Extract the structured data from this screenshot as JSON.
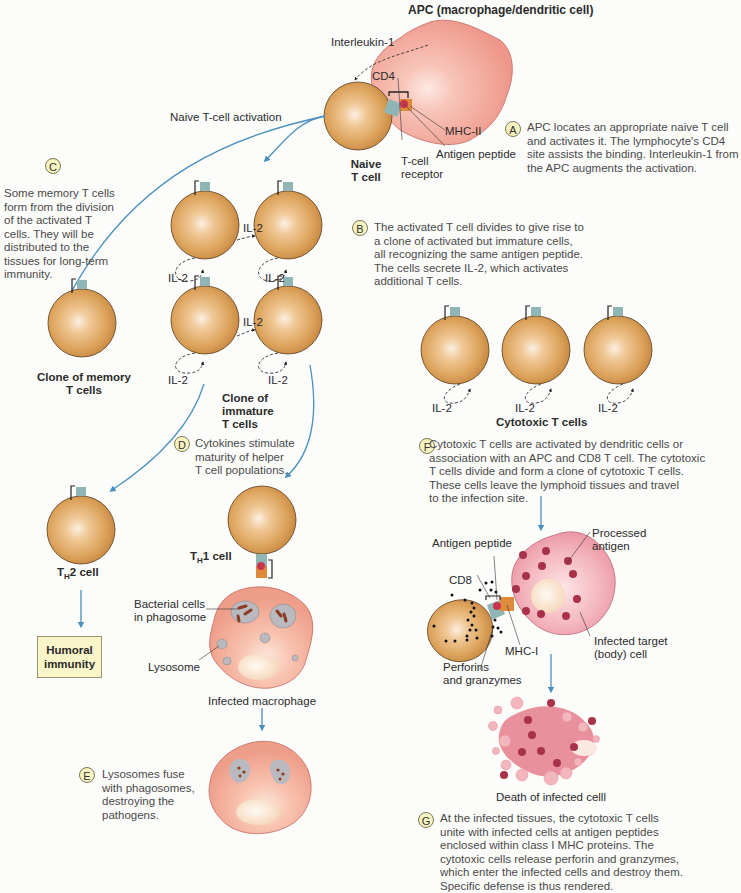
{
  "title": "APC (macrophage/dendritic cell)",
  "labels": {
    "interleukin1": "Interleukin-1",
    "cd4": "CD4",
    "mhc2": "MHC-II",
    "antigen_peptide_top": "Antigen peptide",
    "tcell_receptor_1": "T-cell",
    "tcell_receptor_2": "receptor",
    "naive_1": "Naive",
    "naive_2": "T cell",
    "naive_activation": "Naive T-cell activation",
    "il2": "IL-2",
    "clone_memory_1": "Clone of memory",
    "clone_memory_2": "T cells",
    "clone_immature_1": "Clone of",
    "clone_immature_2": "immature",
    "clone_immature_3": "T cells",
    "cytotoxic": "Cytotoxic T cells",
    "th2_prefix": "T",
    "th2_sub": "H",
    "th2_suffix": "2 cell",
    "th1_prefix": "T",
    "th1_sub": "H",
    "th1_suffix": "1 cell",
    "humoral_1": "Humoral",
    "humoral_2": "immunity",
    "bacterial_1": "Bacterial cells",
    "bacterial_2": "in phagosome",
    "lysosome": "Lysosome",
    "infected_macrophage": "Infected macrophage",
    "antigen_peptide_f": "Antigen peptide",
    "processed_1": "Processed",
    "processed_2": "antigen",
    "cd8": "CD8",
    "mhc1": "MHC-I",
    "perforins_1": "Perforins",
    "perforins_2": "and granzymes",
    "infected_target_1": "Infected target",
    "infected_target_2": "(body) cell",
    "death": "Death of infected celll"
  },
  "notes": {
    "A": {
      "badge": "A",
      "lines": [
        "APC locates an appropriate naive T cell",
        "and activates it. The lymphocyte's CD4",
        "site assists the binding. Interleukin-1 from",
        "the APC augments the activation."
      ]
    },
    "B": {
      "badge": "B",
      "lines": [
        "The activated T cell divides to give rise to",
        "a clone of activated but immature cells,",
        "all recognizing the same antigen peptide.",
        "The cells secrete IL-2, which activates",
        "additional T cells."
      ]
    },
    "C": {
      "badge": "C",
      "lines": [
        "Some memory T cells",
        "form from the division",
        "of the activated T",
        "cells. They will be",
        "distributed to the",
        "tissues for long-term",
        "immunity."
      ]
    },
    "D": {
      "badge": "D",
      "lines": [
        "Cytokines stimulate",
        "maturity of helper",
        "T cell populations."
      ]
    },
    "E": {
      "badge": "E",
      "lines": [
        "Lysosomes fuse",
        "with phagosomes,",
        "destroying the",
        "pathogens."
      ]
    },
    "F": {
      "badge": "F",
      "lines": [
        "Cytotoxic T cells are activated by dendritic cells or",
        "association with an APC and CD8 T cell. The cytotoxic",
        "T cells divide and form a clone of cytotoxic T cells.",
        "These cells leave the lymphoid tissues and travel",
        "to the infection site."
      ]
    },
    "G": {
      "badge": "G",
      "lines": [
        "At the infected tissues, the cytotoxic T cells",
        "unite with infected cells at antigen peptides",
        "enclosed within class I MHC proteins. The",
        "cytotoxic cells release perforin and granzymes,",
        "which enter the infected cells and destroy them.",
        "Specific defense is thus rendered."
      ]
    }
  },
  "colors": {
    "tcell": "#d9a058",
    "tcell_edge": "#5a3f20",
    "apc": "#f2a79a",
    "arrow": "#4a90bf",
    "receptor": "#8fb5b5",
    "mhc": "#e08a3c",
    "antigen": "#c8344e",
    "badge_fill": "#f7f3c0",
    "humoral_box": "#faf5c8"
  }
}
